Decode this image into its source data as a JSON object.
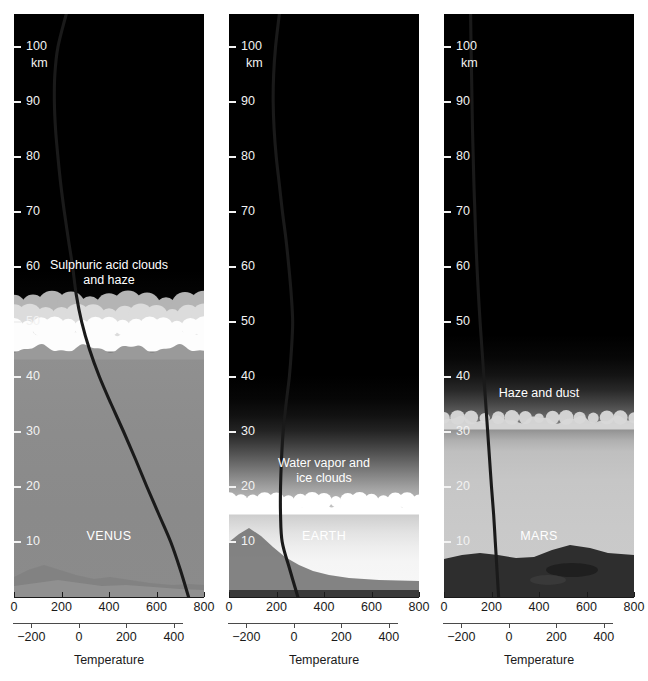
{
  "figure": {
    "panel_count": 3
  },
  "axes": {
    "altitude_unit": "km",
    "altitude_ticks": [
      10,
      20,
      30,
      40,
      50,
      60,
      70,
      80,
      90,
      100
    ],
    "altitude_range": [
      0,
      106
    ],
    "kelvin_ticks": [
      0,
      200,
      400,
      600,
      800
    ],
    "kelvin_range": [
      0,
      800
    ],
    "celsius_ticks": [
      -200,
      0,
      200,
      400
    ],
    "celsius_range": [
      -273,
      527
    ],
    "temperature_title": "Temperature"
  },
  "colors": {
    "space_black": "#000000",
    "curve": "#1a1a1a",
    "tick_label_light": "#f2f2f2",
    "in_panel_label": "#ffffff",
    "axis_line": "#1a1a1a",
    "venus_cloud_bright": "#fdfdfd",
    "venus_cloud_mid": "#dcdcdc",
    "venus_cloud_dim": "#b4b4b4",
    "venus_lower_haze": "#8a8a8a",
    "earth_cloud": "#ffffff",
    "earth_lower": "#f0f0f0",
    "mars_haze": "#d8d8d8",
    "mars_lower": "#c8c8c8",
    "mars_surface": "#2e2e2e"
  },
  "panels": [
    {
      "id": "venus",
      "planet_label": "VENUS",
      "planet_label_altitude": 11,
      "feature_label": "Sulphuric acid clouds\nand haze",
      "feature_label_line1": "Sulphuric acid clouds",
      "feature_label_line2": "and haze",
      "feature_label_altitude": 59,
      "cloud_top_altitude": 53,
      "cloud_base_altitude": 45,
      "surface_temperature_k": 735,
      "profile": {
        "altitude_km": [
          106,
          100,
          95,
          90,
          85,
          80,
          75,
          70,
          65,
          60,
          55,
          50,
          45,
          40,
          35,
          30,
          25,
          20,
          15,
          10,
          5,
          0
        ],
        "temperature_k": [
          220,
          185,
          172,
          170,
          175,
          185,
          197,
          212,
          229,
          247,
          262,
          285,
          318,
          360,
          410,
          462,
          512,
          560,
          610,
          660,
          700,
          735
        ]
      }
    },
    {
      "id": "earth",
      "planet_label": "EARTH",
      "planet_label_altitude": 11,
      "feature_label_line1": "Water vapor and",
      "feature_label_line2": "ice clouds",
      "feature_label_altitude": 23,
      "cloud_top_altitude": 18,
      "cloud_base_altitude": 15,
      "surface_temperature_k": 290,
      "profile": {
        "altitude_km": [
          106,
          100,
          95,
          90,
          85,
          80,
          75,
          70,
          65,
          60,
          55,
          50,
          45,
          40,
          35,
          30,
          25,
          20,
          15,
          10,
          5,
          0
        ],
        "temperature_k": [
          212,
          196,
          188,
          186,
          190,
          199,
          212,
          225,
          240,
          252,
          262,
          268,
          263,
          254,
          240,
          228,
          221,
          217,
          217,
          224,
          256,
          290
        ]
      }
    },
    {
      "id": "mars",
      "planet_label": "MARS",
      "planet_label_altitude": 11,
      "feature_label_line1": "Haze and dust",
      "feature_label_altitude": 37,
      "cloud_top_altitude": 33,
      "cloud_base_altitude": 31,
      "surface_temperature_k": 230,
      "profile": {
        "altitude_km": [
          106,
          100,
          95,
          90,
          85,
          80,
          75,
          70,
          65,
          60,
          55,
          50,
          45,
          40,
          35,
          30,
          25,
          20,
          15,
          10,
          5,
          0
        ],
        "temperature_k": [
          112,
          114,
          116,
          118,
          120,
          123,
          126,
          130,
          134,
          139,
          145,
          152,
          160,
          168,
          176,
          184,
          192,
          200,
          209,
          216,
          223,
          230
        ]
      }
    }
  ],
  "chart_data": {
    "type": "line",
    "xlabel": "Temperature",
    "ylabel": "km",
    "xlim": [
      0,
      800
    ],
    "ylim": [
      0,
      106
    ],
    "secondary_xlim_celsius": [
      -273,
      527
    ],
    "grid": false,
    "legend": "none",
    "panels": [
      "VENUS",
      "EARTH",
      "MARS"
    ],
    "series": [
      {
        "name": "VENUS",
        "x": [
          220,
          185,
          172,
          170,
          175,
          185,
          197,
          212,
          229,
          247,
          262,
          285,
          318,
          360,
          410,
          462,
          512,
          560,
          610,
          660,
          700,
          735
        ],
        "y": [
          106,
          100,
          95,
          90,
          85,
          80,
          75,
          70,
          65,
          60,
          55,
          50,
          45,
          40,
          35,
          30,
          25,
          20,
          15,
          10,
          5,
          0
        ]
      },
      {
        "name": "EARTH",
        "x": [
          212,
          196,
          188,
          186,
          190,
          199,
          212,
          225,
          240,
          252,
          262,
          268,
          263,
          254,
          240,
          228,
          221,
          217,
          217,
          224,
          256,
          290
        ],
        "y": [
          106,
          100,
          95,
          90,
          85,
          80,
          75,
          70,
          65,
          60,
          55,
          50,
          45,
          40,
          35,
          30,
          25,
          20,
          15,
          10,
          5,
          0
        ]
      },
      {
        "name": "MARS",
        "x": [
          112,
          114,
          116,
          118,
          120,
          123,
          126,
          130,
          134,
          139,
          145,
          152,
          160,
          168,
          176,
          184,
          192,
          200,
          209,
          216,
          223,
          230
        ],
        "y": [
          106,
          100,
          95,
          90,
          85,
          80,
          75,
          70,
          65,
          60,
          55,
          50,
          45,
          40,
          35,
          30,
          25,
          20,
          15,
          10,
          5,
          0
        ]
      }
    ],
    "annotations": [
      {
        "panel": "VENUS",
        "text": "Sulphuric acid clouds and haze",
        "altitude_km": 59
      },
      {
        "panel": "VENUS",
        "text": "VENUS",
        "altitude_km": 11
      },
      {
        "panel": "EARTH",
        "text": "Water vapor and ice clouds",
        "altitude_km": 23
      },
      {
        "panel": "EARTH",
        "text": "EARTH",
        "altitude_km": 11
      },
      {
        "panel": "MARS",
        "text": "Haze and dust",
        "altitude_km": 37
      },
      {
        "panel": "MARS",
        "text": "MARS",
        "altitude_km": 11
      }
    ]
  }
}
